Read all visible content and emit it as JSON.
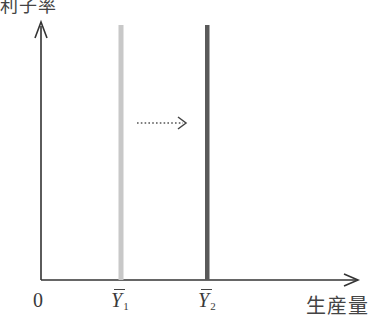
{
  "diagram": {
    "top_label": "利子率",
    "origin_label": "0",
    "x_axis_label": "生産量",
    "lines": [
      {
        "name": "Y1",
        "symbol": "Y",
        "subscript": "1",
        "color": "#c4c4c4",
        "x": 121
      },
      {
        "name": "Y2",
        "symbol": "Y",
        "subscript": "2",
        "color": "#5a5a5a",
        "x": 207
      }
    ],
    "shift_arrow": {
      "style": "dotted",
      "direction": "right"
    },
    "colors": {
      "axis": "#333333",
      "light_line": "#c4c4c4",
      "dark_line": "#5a5a5a"
    }
  }
}
